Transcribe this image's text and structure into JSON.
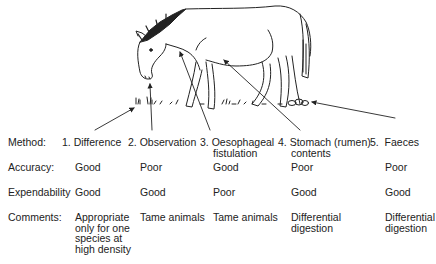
{
  "rows": {
    "method": {
      "label": "Method:"
    },
    "accuracy": {
      "label": "Accuracy:"
    },
    "expendability": {
      "label": "Expendability"
    },
    "comments": {
      "label": "Comments:"
    }
  },
  "methods": [
    {
      "num": "1.",
      "name": "Difference",
      "name2": "",
      "accuracy": "Good",
      "expendability": "Good",
      "comment": [
        "Appropriate",
        "only for one",
        "species at",
        "high density"
      ]
    },
    {
      "num": "2.",
      "name": "Observation",
      "name2": "",
      "accuracy": "Poor",
      "expendability": "Good",
      "comment": [
        "Tame animals"
      ]
    },
    {
      "num": "3.",
      "name": "Oesophageal",
      "name2": "fistulation",
      "accuracy": "Good",
      "expendability": "Poor",
      "comment": [
        "Tame animals"
      ]
    },
    {
      "num": "4.",
      "name": "Stomach (rumen)",
      "name2": "contents",
      "accuracy": "Poor",
      "expendability": "Good",
      "comment": [
        "Differential",
        "digestion"
      ]
    },
    {
      "num": "5.",
      "name": "Faeces",
      "name2": "",
      "accuracy": "Poor",
      "expendability": "Good",
      "comment": [
        "Differential",
        "digestion"
      ]
    }
  ],
  "illustration": {
    "subject": "grazing-horse",
    "arrow_targets": [
      "grass-ground",
      "mouth",
      "oesophagus-neck",
      "stomach-belly",
      "faeces-droppings"
    ]
  }
}
